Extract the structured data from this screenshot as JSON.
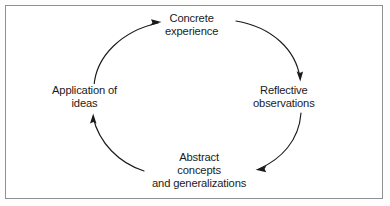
{
  "figure": {
    "kind": "cycle-diagram",
    "orientation": "clockwise",
    "frame_color": "#8f9094",
    "line_color": "#1b1b1b",
    "background_color": "#ffffff",
    "text_color": "#1b1b1b"
  },
  "nodes": {
    "concrete_experience": {
      "line1": "Concrete",
      "line2": "experience"
    },
    "reflective_observations": {
      "line1": "Reflective",
      "line2": "observations"
    },
    "abstract_concepts": {
      "line1": "Abstract",
      "line2": "concepts",
      "line3": "and generalizations"
    },
    "application_of_ideas": {
      "line1": "Application of",
      "line2": "ideas"
    }
  },
  "arrows": [
    {
      "name": "arrow-to-concrete-experience",
      "direction": "right",
      "target": "concrete_experience"
    },
    {
      "name": "arrow-to-reflective-observations",
      "direction": "down",
      "target": "reflective_observations"
    },
    {
      "name": "arrow-to-abstract-concepts",
      "direction": "left",
      "target": "abstract_concepts"
    },
    {
      "name": "arrow-to-application-of-ideas",
      "direction": "up",
      "target": "application_of_ideas"
    }
  ]
}
